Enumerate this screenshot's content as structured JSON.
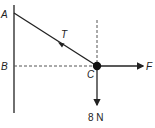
{
  "diagram": {
    "type": "force-diagram",
    "colors": {
      "line": "#222222",
      "dashed": "#555555",
      "background": "#ffffff"
    },
    "points": [
      {
        "id": "A",
        "label": "A"
      },
      {
        "id": "B",
        "label": "B"
      },
      {
        "id": "C",
        "label": "C"
      }
    ],
    "forces": [
      {
        "id": "tension",
        "label": "T"
      },
      {
        "id": "applied",
        "label": "F"
      },
      {
        "id": "weight",
        "label": "8 N"
      }
    ]
  }
}
